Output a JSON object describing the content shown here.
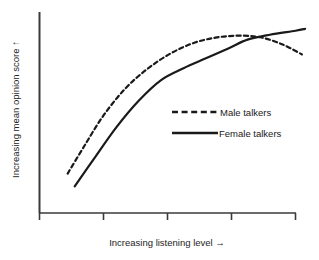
{
  "chart_data": {
    "type": "line",
    "title": "",
    "xlabel": "Increasing listening level →",
    "ylabel": "Increasing mean opinion score ↑",
    "xlim": [
      0,
      4
    ],
    "ylim": [
      0,
      10
    ],
    "grid": false,
    "axis_tick_labels": [],
    "axis_ticks_x": [
      0,
      1,
      2,
      3,
      4
    ],
    "legend_position": "center-right",
    "series": [
      {
        "name": "Male talkers",
        "style": "dashed",
        "color": "#1a1a1a",
        "x": [
          0.44,
          0.7,
          1.0,
          1.35,
          1.7,
          2.05,
          2.4,
          2.75,
          3.1,
          3.45,
          3.8,
          4.1
        ],
        "y": [
          2.0,
          3.4,
          4.95,
          6.35,
          7.35,
          8.1,
          8.62,
          8.9,
          9.0,
          8.92,
          8.55,
          8.05
        ]
      },
      {
        "name": "Female talkers",
        "style": "solid",
        "color": "#1a1a1a",
        "x": [
          0.55,
          0.85,
          1.2,
          1.55,
          1.9,
          2.25,
          2.6,
          2.95,
          3.25,
          3.6,
          4.0,
          4.15
        ],
        "y": [
          1.35,
          2.75,
          4.35,
          5.7,
          6.75,
          7.35,
          7.85,
          8.35,
          8.8,
          9.05,
          9.25,
          9.35
        ]
      }
    ]
  },
  "legend": {
    "male_label": "Male talkers",
    "female_label": "Female talkers"
  },
  "axes": {
    "y_axis_label": "Increasing mean opinion score ↑",
    "x_axis_label": "Increasing listening level →"
  },
  "colors": {
    "background": "#ffffff",
    "ink": "#1a1a1a",
    "axis": "#3a3a3a"
  }
}
